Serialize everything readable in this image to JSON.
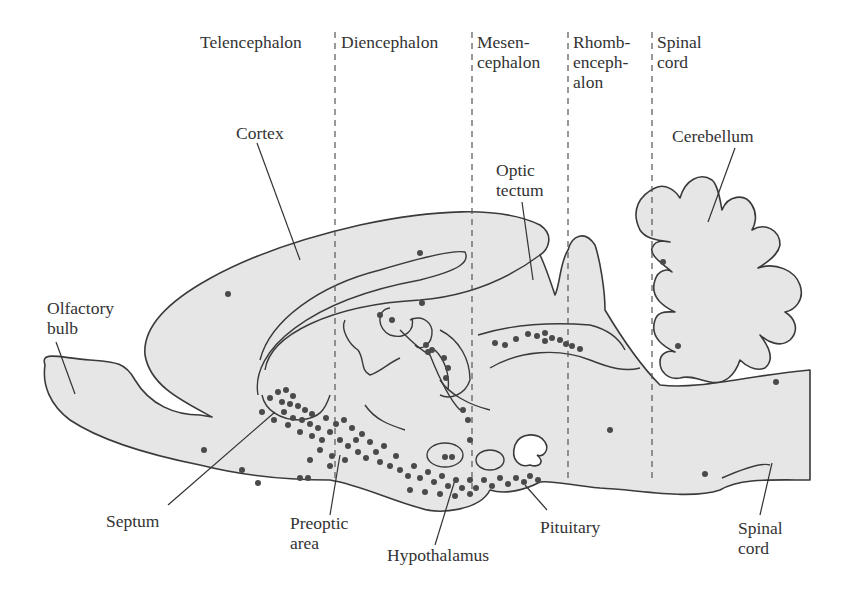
{
  "figure": {
    "type": "sagittal brain section diagram",
    "colors": {
      "tissue_fill": "#e6e6e6",
      "outline": "#3a3a3a",
      "dots": "#4a4a4a",
      "divider": "#555555",
      "text": "#333333"
    }
  },
  "regions": [
    {
      "label": "Telencephalon"
    },
    {
      "label": "Diencephalon"
    },
    {
      "label": "Mesen-\ncephalon"
    },
    {
      "label": "Rhomb-\nenceph-\nalon"
    },
    {
      "label": "Spinal\ncord"
    }
  ],
  "labels": {
    "cortex": "Cortex",
    "optic_tectum": "Optic\ntectum",
    "cerebellum": "Cerebellum",
    "olfactory_bulb": "Olfactory\nbulb",
    "septum": "Septum",
    "preoptic_area": "Preoptic\narea",
    "hypothalamus": "Hypothalamus",
    "pituitary": "Pituitary",
    "spinal_cord": "Spinal\ncord"
  }
}
